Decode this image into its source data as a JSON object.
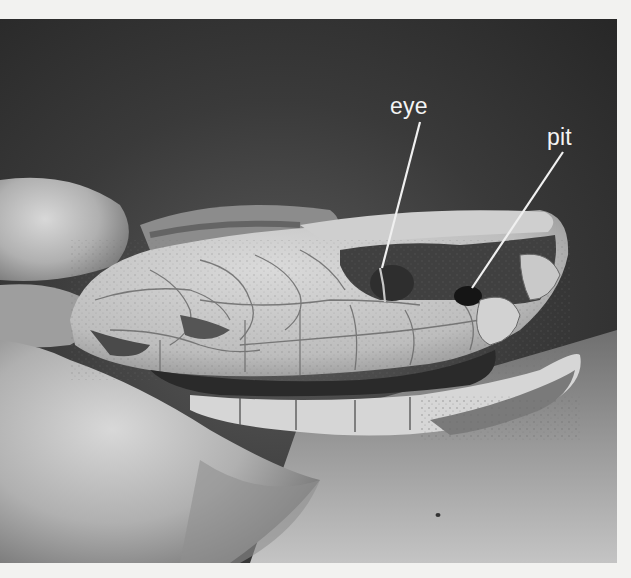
{
  "figure": {
    "labels": [
      {
        "id": "eye",
        "text": "eye"
      },
      {
        "id": "pit",
        "text": "pit"
      }
    ],
    "colors": {
      "page_background": "#f2f2f0",
      "photo_background_dark": "#2e2e2e",
      "label_text": "#f4f4f4",
      "pointer_line": "#f0f0f0"
    }
  }
}
